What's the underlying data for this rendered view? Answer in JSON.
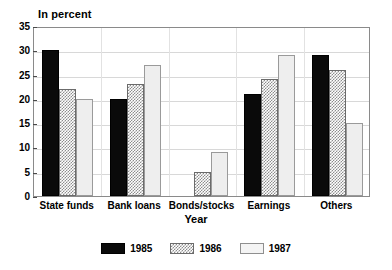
{
  "chart_data": {
    "type": "bar",
    "title": "In percent",
    "xlabel": "Year",
    "ylabel": "",
    "ylim": [
      0,
      35
    ],
    "ytick_step": 5,
    "yticks": [
      0,
      5,
      10,
      15,
      20,
      25,
      30,
      35
    ],
    "ytick_labels": [
      "0",
      "5",
      "10",
      "15",
      "20",
      "25",
      "30",
      "35"
    ],
    "grid": true,
    "legend_position": "bottom-center",
    "categories": [
      "State funds",
      "Bank loans",
      "Bonds/stocks",
      "Earnings",
      "Others"
    ],
    "series": [
      {
        "name": "1985",
        "color": "#0a0a0a",
        "fill": "solid-black",
        "values": [
          30,
          20,
          0,
          21,
          29
        ]
      },
      {
        "name": "1986",
        "color": "#8d8d8d",
        "fill": "checker-hatch",
        "values": [
          22,
          23,
          5,
          24,
          26
        ]
      },
      {
        "name": "1987",
        "color": "#eeeeee",
        "fill": "light-solid",
        "values": [
          20,
          27,
          9,
          29,
          15
        ]
      }
    ]
  },
  "legend": {
    "entries": [
      {
        "label": "1985"
      },
      {
        "label": "1986"
      },
      {
        "label": "1987"
      }
    ]
  }
}
